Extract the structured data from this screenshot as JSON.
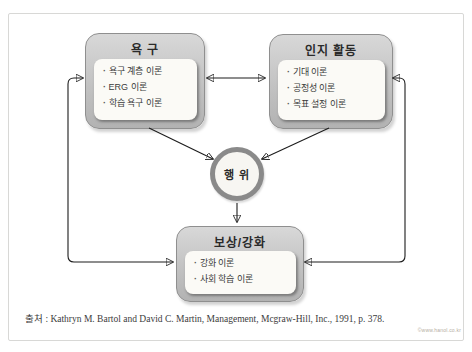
{
  "diagram": {
    "nodes": {
      "needs": {
        "title": "욕 구",
        "items": [
          "욕구 계층 이론",
          "ERG 이론",
          "학습 욕구 이론"
        ]
      },
      "cognition": {
        "title": "인지 활동",
        "items": [
          "기대 이론",
          "공정성 이론",
          "목표 설정 이론"
        ]
      },
      "behavior": {
        "title": "행 위"
      },
      "reward": {
        "title": "보상/강화",
        "items": [
          "강화 이론",
          "사회 학습 이론"
        ]
      }
    },
    "arrows": {
      "needs_cognition": "bidirectional",
      "reward_needs": "bidirectional-elbow-left",
      "reward_cognition": "bidirectional-elbow-right",
      "needs_to_behavior": "one-way",
      "cognition_to_behavior": "one-way",
      "behavior_to_reward": "one-way"
    },
    "colors": {
      "box_fill_top": "#d8d8d8",
      "box_fill_bottom": "#b2b2b2",
      "box_border": "#8f8f8f",
      "panel_fill": "#fbfaf6",
      "circle_ring": "#8a8a8a",
      "arrow": "#1c1c1c",
      "frame_border": "#d8d8d6"
    }
  },
  "caption": {
    "text": "출처 : Kathryn M. Bartol and David C. Martin, Management, Mcgraw-Hill, Inc., 1991, p. 378."
  },
  "watermark": {
    "text": "©www.hanol.co.kr"
  }
}
